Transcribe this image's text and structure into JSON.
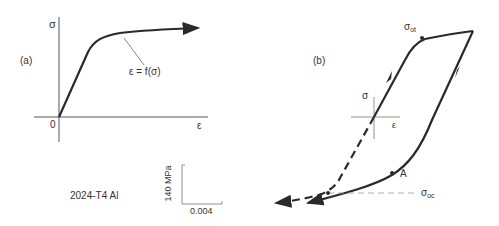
{
  "panel_a": {
    "label": "(a)",
    "y_axis_label": "σ",
    "x_axis_label": "ε",
    "origin_label": "0",
    "curve_annotation": "ε = f(σ)",
    "material": "2024-T4 Al",
    "scale_bar": {
      "vertical": "140 MPa",
      "horizontal": "0.004"
    }
  },
  "panel_b": {
    "label": "(b)",
    "inset_sigma": "σ",
    "inset_epsilon": "ε",
    "point_ot": {
      "main": "σ",
      "sub": "ot"
    },
    "point_a": "A",
    "point_oc": {
      "main": "σ",
      "sub": "oc"
    }
  },
  "colors": {
    "curve": "#2a2a2a",
    "axis": "#555555",
    "guide": "#999999",
    "text": "#333333"
  }
}
